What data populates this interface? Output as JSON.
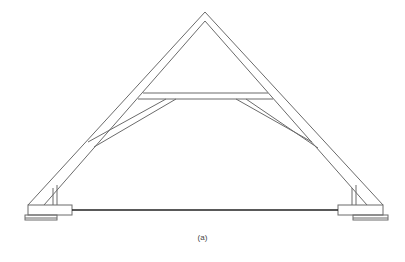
{
  "figure": {
    "caption": "(a)",
    "colors": {
      "line": "#6b6b6b",
      "tie": "#222222",
      "background": "#ffffff"
    }
  }
}
